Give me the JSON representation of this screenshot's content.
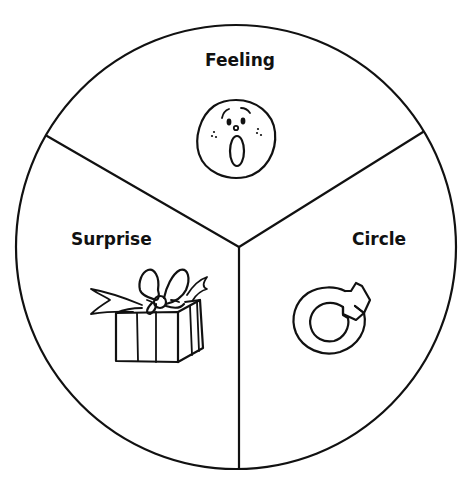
{
  "diagram": {
    "type": "three-segment circle (pie divided into thirds)",
    "outline_color": "#111111",
    "background_color": "#ffffff",
    "segments": [
      {
        "position": "top",
        "label": "Feeling",
        "icon": "surprised-face-icon"
      },
      {
        "position": "bottom-left",
        "label": "Surprise",
        "icon": "gift-box-icon"
      },
      {
        "position": "bottom-right",
        "label": "Circle",
        "icon": "circular-arrow-icon"
      }
    ]
  }
}
